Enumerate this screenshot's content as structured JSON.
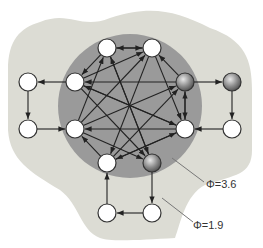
{
  "diagram": {
    "type": "network-graph",
    "regions": [
      {
        "id": "outer",
        "label": "Φ=1.9",
        "color": "#dcdcd4"
      },
      {
        "id": "inner",
        "label": "Φ=3.6",
        "color": "#9a9a9a"
      }
    ],
    "labels": {
      "phi_inner": "Φ=3.6",
      "phi_outer": "Φ=1.9"
    },
    "nodes": [
      {
        "id": "c1",
        "x": 107,
        "y": 48,
        "style": "white"
      },
      {
        "id": "c2",
        "x": 152,
        "y": 48,
        "style": "white"
      },
      {
        "id": "c3",
        "x": 75,
        "y": 82,
        "style": "white"
      },
      {
        "id": "c4",
        "x": 185,
        "y": 82,
        "style": "gray"
      },
      {
        "id": "c5",
        "x": 75,
        "y": 129,
        "style": "white"
      },
      {
        "id": "c6",
        "x": 185,
        "y": 129,
        "style": "white"
      },
      {
        "id": "c7",
        "x": 107,
        "y": 163,
        "style": "white"
      },
      {
        "id": "c8",
        "x": 152,
        "y": 163,
        "style": "gray"
      },
      {
        "id": "o1",
        "x": 28,
        "y": 82,
        "style": "white"
      },
      {
        "id": "o2",
        "x": 28,
        "y": 129,
        "style": "white"
      },
      {
        "id": "o3",
        "x": 232,
        "y": 82,
        "style": "gray"
      },
      {
        "id": "o4",
        "x": 232,
        "y": 129,
        "style": "white"
      },
      {
        "id": "o5",
        "x": 107,
        "y": 213,
        "style": "white"
      },
      {
        "id": "o6",
        "x": 152,
        "y": 213,
        "style": "white"
      }
    ],
    "outer_edges": [
      [
        "c3",
        "o1"
      ],
      [
        "o1",
        "o2"
      ],
      [
        "o2",
        "c5"
      ],
      [
        "c4",
        "o3"
      ],
      [
        "o3",
        "o4"
      ],
      [
        "o4",
        "c6"
      ],
      [
        "c8",
        "o6"
      ],
      [
        "o6",
        "o5"
      ],
      [
        "o5",
        "c7"
      ]
    ],
    "inner_edges": [
      [
        "c1",
        "c2"
      ],
      [
        "c2",
        "c1"
      ],
      [
        "c1",
        "c3"
      ],
      [
        "c3",
        "c2"
      ],
      [
        "c4",
        "c2"
      ],
      [
        "c4",
        "c3"
      ],
      [
        "c4",
        "c6"
      ],
      [
        "c6",
        "c4"
      ],
      [
        "c5",
        "c1"
      ],
      [
        "c5",
        "c4"
      ],
      [
        "c6",
        "c5"
      ],
      [
        "c6",
        "c3"
      ],
      [
        "c7",
        "c5"
      ],
      [
        "c7",
        "c4"
      ],
      [
        "c2",
        "c7"
      ],
      [
        "c1",
        "c8"
      ],
      [
        "c3",
        "c8"
      ],
      [
        "c5",
        "c8"
      ],
      [
        "c6",
        "c7"
      ],
      [
        "c2",
        "c6"
      ],
      [
        "c8",
        "c1"
      ],
      [
        "c7",
        "c6"
      ],
      [
        "c3",
        "c6"
      ],
      [
        "c5",
        "c2"
      ]
    ]
  }
}
